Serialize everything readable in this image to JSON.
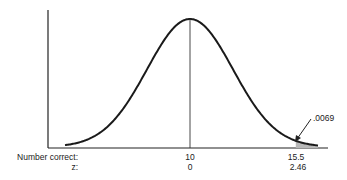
{
  "chart_data": {
    "type": "area",
    "title": "",
    "xlabel": "Number correct",
    "secondary_xlabel": "z",
    "x_ticks": [
      {
        "number_correct": "10",
        "z": "0"
      },
      {
        "number_correct": "15.5",
        "z": "2.46"
      }
    ],
    "mean": 10,
    "cutoff": 15.5,
    "cutoff_z": 2.46,
    "shaded_region": "right tail beyond z = 2.46",
    "annotation": ".0069",
    "grid": false,
    "legend": null
  },
  "labels": {
    "row1_title": "Number correct:",
    "row2_title": "z:",
    "mean_value": "10",
    "mean_z": "0",
    "cutoff_value": "15.5",
    "cutoff_z": "2.46",
    "tail_prob": ".0069"
  },
  "colors": {
    "curve": "#1a1a1a",
    "shade": "#b8b8b8"
  }
}
